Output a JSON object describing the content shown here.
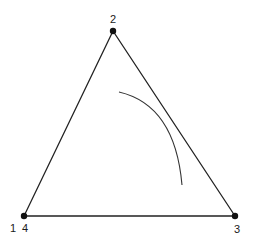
{
  "diagram": {
    "type": "triangle-with-arc",
    "colors": {
      "stroke": "#222222",
      "arc": "#333333",
      "vertex": "#111111",
      "background": "#ffffff"
    },
    "vertices": [
      {
        "id": "top",
        "label": "2",
        "x": 113,
        "y": 31
      },
      {
        "id": "bottom-left",
        "label": "1",
        "label2": "4",
        "x": 24,
        "y": 216
      },
      {
        "id": "bottom-right",
        "label": "3",
        "x": 235,
        "y": 216
      }
    ],
    "labels": {
      "top": "2",
      "bottom_left_a": "1",
      "bottom_left_b": "4",
      "bottom_right": "3"
    },
    "arc": {
      "start": [
        119,
        92
      ],
      "control": [
        175,
        105
      ],
      "end": [
        182,
        185
      ]
    }
  }
}
